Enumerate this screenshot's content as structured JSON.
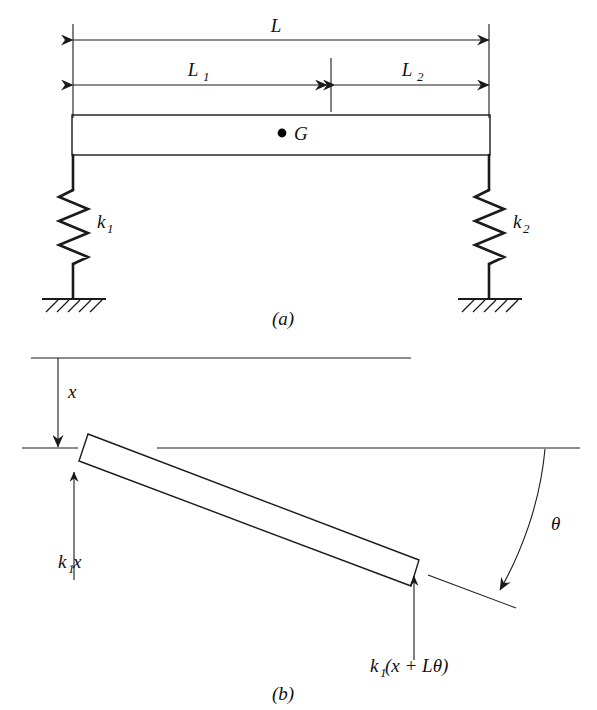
{
  "figure": {
    "title_a": "(a)",
    "title_b": "(b)",
    "background_color": "#ffffff",
    "line_color": "#1a1a1a"
  },
  "panel_a": {
    "name": "rigid-bar-on-two-springs",
    "dimension_labels": {
      "total_length": "L",
      "left_length": "L",
      "left_length_sub": "1",
      "right_length": "L",
      "right_length_sub": "2"
    },
    "center_of_gravity": {
      "marker": "bullet-dot",
      "label": "G"
    },
    "springs": [
      {
        "name": "left-spring",
        "label": "k",
        "sub": "1"
      },
      {
        "name": "right-spring",
        "label": "k",
        "sub": "2"
      }
    ],
    "supports": [
      {
        "name": "left-ground-support",
        "type": "hatched-ground"
      },
      {
        "name": "right-ground-support",
        "type": "hatched-ground"
      }
    ],
    "caption": "(a)"
  },
  "panel_b": {
    "name": "displaced-free-body-diagram",
    "displacement_label": "x",
    "angle_label": "θ",
    "forces": [
      {
        "name": "left-spring-force",
        "label_k": "k",
        "label_sub": "1",
        "label_rest": "x",
        "full": "k₁x",
        "direction": "up"
      },
      {
        "name": "right-spring-force",
        "label_k": "k",
        "label_sub": "1",
        "label_rest": "(x + Lθ)",
        "full": "k₁(x + Lθ)",
        "direction": "up"
      }
    ],
    "caption": "(b)"
  }
}
